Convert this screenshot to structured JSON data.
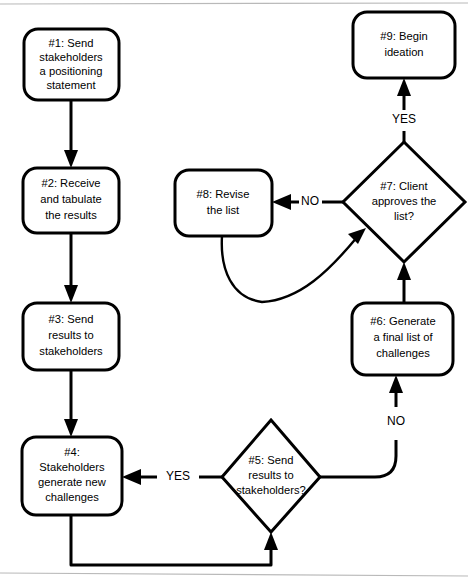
{
  "diagram": {
    "background_color": "#ffffff",
    "line_color": "#000000",
    "rule_color": "#b9b9b9",
    "nodes": [
      {
        "id": "n1",
        "shape": "rounded-rectangle",
        "lines": [
          "#1: Send",
          "stakeholders",
          "a positioning",
          "statement"
        ]
      },
      {
        "id": "n2",
        "shape": "rounded-rectangle",
        "lines": [
          "#2: Receive",
          "and tabulate",
          "the results"
        ]
      },
      {
        "id": "n3",
        "shape": "rounded-rectangle",
        "lines": [
          "#3: Send",
          "results to",
          "stakeholders"
        ]
      },
      {
        "id": "n4",
        "shape": "rounded-rectangle",
        "lines": [
          "#4:",
          "Stakeholders",
          "generate new",
          "challenges"
        ]
      },
      {
        "id": "n5",
        "shape": "diamond",
        "lines": [
          "#5: Send",
          "results to",
          "stakeholders?"
        ]
      },
      {
        "id": "n6",
        "shape": "rounded-rectangle",
        "lines": [
          "#6: Generate",
          "a final list of",
          "challenges"
        ]
      },
      {
        "id": "n7",
        "shape": "diamond",
        "lines": [
          "#7: Client",
          "approves the",
          "list?"
        ]
      },
      {
        "id": "n8",
        "shape": "rounded-rectangle",
        "lines": [
          "#8: Revise",
          "the list"
        ]
      },
      {
        "id": "n9",
        "shape": "rounded-rectangle",
        "lines": [
          "#9: Begin",
          "ideation"
        ]
      }
    ],
    "edge_labels": {
      "n5_to_n4": "YES",
      "n5_to_n6": "NO",
      "n7_to_n8": "NO",
      "n7_to_n9": "YES"
    }
  }
}
